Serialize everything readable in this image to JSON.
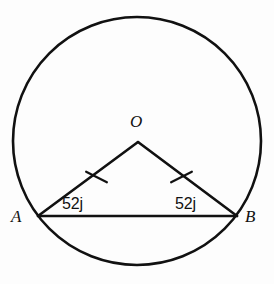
{
  "figure": {
    "kind": "geometry-diagram",
    "stroke_color": "#111111",
    "background_color": "#fdfdfd",
    "canvas": {
      "width": 274,
      "height": 284
    }
  },
  "circle": {
    "center_x": 137,
    "center_y": 141,
    "radius": 124,
    "stroke_width": 2.6
  },
  "points": {
    "O": {
      "label": "O",
      "x": 138,
      "y": 142
    },
    "A": {
      "label": "A",
      "x": 38,
      "y": 216
    },
    "B": {
      "label": "B",
      "x": 237,
      "y": 216
    }
  },
  "segments": [
    {
      "name": "radius-OA",
      "from": "O",
      "to": "A",
      "tick_marks": 1
    },
    {
      "name": "radius-OB",
      "from": "O",
      "to": "B",
      "tick_marks": 1
    },
    {
      "name": "chord-AB",
      "from": "A",
      "to": "B",
      "tick_marks": 0
    }
  ],
  "angles": {
    "at_A": {
      "value": "52",
      "unit_glyph": "ј",
      "text": "52ј"
    },
    "at_B": {
      "value": "52",
      "unit_glyph": "ј",
      "text": "52ј"
    }
  },
  "tick_marks": {
    "left": {
      "cx": 96,
      "cy": 177,
      "length": 18,
      "angle_deg": -35
    },
    "right": {
      "cx": 181,
      "cy": 177,
      "length": 18,
      "angle_deg": 35
    }
  }
}
